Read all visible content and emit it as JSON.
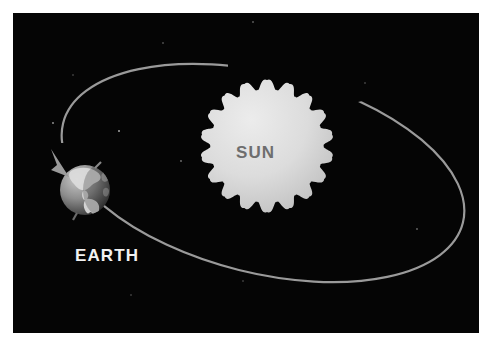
{
  "figure": {
    "background_color": "#ffffff",
    "space_color": "#050505",
    "frame_margin_px": 13
  },
  "labels": {
    "sun": "SUN",
    "earth": "EARTH"
  },
  "colors": {
    "space": "#050505",
    "sun_disk_light": "#e4e4e4",
    "sun_disk_dark": "#c2c2c2",
    "sun_label_text": "#6e6e6e",
    "earth_label_text": "#f2f2f2",
    "earth_ocean_light": "#b9b9b9",
    "earth_ocean_dark": "#4b4b4b",
    "earth_land": "#dcdcdc",
    "orbit_line": "#9a9a9a",
    "arrow": "#9a9a9a",
    "star": "#cfcfcf"
  },
  "objects": {
    "sun": {
      "name": "Sun",
      "center_x": 254,
      "center_y": 133,
      "radius": 66,
      "flame_points": 18,
      "flame_depth": 9
    },
    "earth": {
      "name": "Earth",
      "center_x": 72,
      "center_y": 177,
      "radius": 25,
      "continents": "North and South America"
    },
    "orbit": {
      "name": "Elliptical orbit path",
      "center_x": 250,
      "center_y": 160,
      "radius_x": 206,
      "radius_y": 100,
      "rotation_deg": 14,
      "stroke_width": 2.2
    },
    "arrow": {
      "name": "Direction of revolution arrow",
      "tip_x": 55,
      "tip_y": 163,
      "direction": "down-right toward Earth"
    }
  },
  "stars": [
    {
      "x": 40,
      "y": 110,
      "r": 0.9
    },
    {
      "x": 106,
      "y": 118,
      "r": 1.0
    },
    {
      "x": 150,
      "y": 30,
      "r": 0.8
    },
    {
      "x": 168,
      "y": 148,
      "r": 0.9
    },
    {
      "x": 240,
      "y": 9,
      "r": 0.8
    },
    {
      "x": 352,
      "y": 70,
      "r": 0.8
    },
    {
      "x": 404,
      "y": 216,
      "r": 0.9
    },
    {
      "x": 230,
      "y": 268,
      "r": 0.8
    },
    {
      "x": 118,
      "y": 282,
      "r": 0.8
    },
    {
      "x": 60,
      "y": 62,
      "r": 0.8
    }
  ],
  "chart_data": {
    "type": "diagram",
    "elements": [
      {
        "label": "SUN",
        "role": "central body",
        "shape": "flame-edged disk"
      },
      {
        "label": "EARTH",
        "role": "orbiting body",
        "shape": "sphere with continents"
      },
      {
        "label": "",
        "role": "orbit path",
        "shape": "tilted ellipse"
      },
      {
        "label": "",
        "role": "revolution direction arrow",
        "shape": "arrowhead"
      }
    ]
  }
}
